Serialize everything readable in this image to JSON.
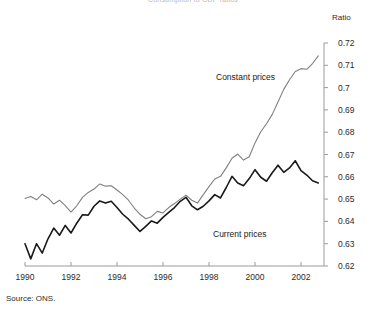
{
  "chart_data": {
    "type": "line",
    "title": "Consumption to GDP ratios",
    "xlabel": "",
    "ylabel": "Ratio",
    "ylim": [
      0.62,
      0.72
    ],
    "xlim": [
      1990,
      2003
    ],
    "yticks": [
      "0.62",
      "0.63",
      "0.64",
      "0.65",
      "0.66",
      "0.67",
      "0.68",
      "0.69",
      "0.7",
      "0.71",
      "0.72"
    ],
    "ytick_values": [
      0.62,
      0.63,
      0.64,
      0.65,
      0.66,
      0.67,
      0.68,
      0.69,
      0.7,
      0.71,
      0.72
    ],
    "xticks": [
      "1990",
      "1992",
      "1994",
      "1996",
      "1998",
      "2000",
      "2002"
    ],
    "xtick_values": [
      1990,
      1992,
      1994,
      1996,
      1998,
      2000,
      2002
    ],
    "grid": false,
    "legend_position": "inline-annotation",
    "source": "Source: ONS.",
    "axis_color": "#9a9a9a",
    "series": [
      {
        "name": "Constant prices",
        "color": "#808080",
        "label_x": 1999.6,
        "label_y": 0.6985,
        "x": [
          1990.0,
          1990.25,
          1990.5,
          1990.75,
          1991.0,
          1991.25,
          1991.5,
          1991.75,
          1992.0,
          1992.25,
          1992.5,
          1992.75,
          1993.0,
          1993.25,
          1993.5,
          1993.75,
          1994.0,
          1994.25,
          1994.5,
          1994.75,
          1995.0,
          1995.25,
          1995.5,
          1995.75,
          1996.0,
          1996.25,
          1996.5,
          1996.75,
          1997.0,
          1997.25,
          1997.5,
          1997.75,
          1998.0,
          1998.25,
          1998.5,
          1998.75,
          1999.0,
          1999.25,
          1999.5,
          1999.75,
          2000.0,
          2000.25,
          2000.5,
          2000.75,
          2001.0,
          2001.25,
          2001.5,
          2001.75,
          2002.0,
          2002.25,
          2002.5,
          2002.75
        ],
        "values": [
          0.6503,
          0.6512,
          0.6497,
          0.6522,
          0.6505,
          0.6478,
          0.6495,
          0.6471,
          0.6442,
          0.647,
          0.6508,
          0.653,
          0.6545,
          0.6568,
          0.6558,
          0.656,
          0.6541,
          0.652,
          0.6495,
          0.646,
          0.6432,
          0.6412,
          0.6421,
          0.6445,
          0.6438,
          0.6462,
          0.648,
          0.65,
          0.6518,
          0.6495,
          0.6482,
          0.652,
          0.6556,
          0.659,
          0.6602,
          0.664,
          0.6683,
          0.6702,
          0.6675,
          0.669,
          0.6752,
          0.6802,
          0.6838,
          0.688,
          0.6935,
          0.6992,
          0.7035,
          0.7072,
          0.7085,
          0.7082,
          0.7108,
          0.7142
        ]
      },
      {
        "name": "Current prices",
        "color": "#1a1a1a",
        "label_x": 1998.9,
        "label_y": 0.6318,
        "x": [
          1990.0,
          1990.25,
          1990.5,
          1990.75,
          1991.0,
          1991.25,
          1991.5,
          1991.75,
          1992.0,
          1992.25,
          1992.5,
          1992.75,
          1993.0,
          1993.25,
          1993.5,
          1993.75,
          1994.0,
          1994.25,
          1994.5,
          1994.75,
          1995.0,
          1995.25,
          1995.5,
          1995.75,
          1996.0,
          1996.25,
          1996.5,
          1996.75,
          1997.0,
          1997.25,
          1997.5,
          1997.75,
          1998.0,
          1998.25,
          1998.5,
          1998.75,
          1999.0,
          1999.25,
          1999.5,
          1999.75,
          2000.0,
          2000.25,
          2000.5,
          2000.75,
          2001.0,
          2001.25,
          2001.5,
          2001.75,
          2002.0,
          2002.25,
          2002.5,
          2002.75
        ],
        "values": [
          0.63,
          0.6232,
          0.63,
          0.6258,
          0.6322,
          0.637,
          0.6338,
          0.6382,
          0.6348,
          0.6392,
          0.643,
          0.6428,
          0.6468,
          0.6492,
          0.6482,
          0.649,
          0.6462,
          0.6432,
          0.641,
          0.6382,
          0.6355,
          0.6378,
          0.6402,
          0.6392,
          0.6418,
          0.644,
          0.6462,
          0.649,
          0.6508,
          0.647,
          0.6452,
          0.6468,
          0.6492,
          0.652,
          0.6505,
          0.6552,
          0.6602,
          0.6572,
          0.656,
          0.6592,
          0.6632,
          0.6598,
          0.658,
          0.6618,
          0.6652,
          0.662,
          0.664,
          0.6672,
          0.6628,
          0.6608,
          0.6582,
          0.6572
        ]
      }
    ]
  }
}
